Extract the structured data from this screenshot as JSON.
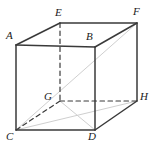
{
  "figure": {
    "name": "cube-diagram",
    "type": "geometric-solid",
    "solid": "cube",
    "background_color": "#ffffff",
    "stroke_color": "#3a3a3a",
    "hidden_stroke_color": "#3a3a3a",
    "faint_stroke_color": "#cfcfcf",
    "label_color": "#1a1a1a",
    "vertices": [
      {
        "id": "A",
        "label": "A",
        "x": 16,
        "y": 45,
        "label_x": 6,
        "label_y": 30,
        "hidden": false
      },
      {
        "id": "B",
        "label": "B",
        "x": 95,
        "y": 47,
        "label_x": 86,
        "label_y": 31,
        "hidden": false
      },
      {
        "id": "C",
        "label": "C",
        "x": 16,
        "y": 130,
        "label_x": 6,
        "label_y": 131,
        "hidden": false
      },
      {
        "id": "D",
        "label": "D",
        "x": 95,
        "y": 130,
        "label_x": 88,
        "label_y": 131,
        "hidden": false
      },
      {
        "id": "E",
        "label": "E",
        "x": 60,
        "y": 23,
        "label_x": 55,
        "label_y": 7,
        "hidden": false
      },
      {
        "id": "F",
        "label": "F",
        "x": 137,
        "y": 23,
        "label_x": 133,
        "label_y": 6,
        "hidden": false
      },
      {
        "id": "G",
        "label": "G",
        "x": 60,
        "y": 101,
        "label_x": 44,
        "label_y": 91,
        "hidden": true
      },
      {
        "id": "H",
        "label": "H",
        "x": 137,
        "y": 101,
        "label_x": 140,
        "label_y": 91,
        "hidden": false
      }
    ],
    "edges": [
      {
        "from": "A",
        "to": "B",
        "style": "solid",
        "name": "edge-ab"
      },
      {
        "from": "A",
        "to": "C",
        "style": "solid",
        "name": "edge-ac"
      },
      {
        "from": "B",
        "to": "D",
        "style": "solid",
        "name": "edge-bd"
      },
      {
        "from": "C",
        "to": "D",
        "style": "solid",
        "name": "edge-cd"
      },
      {
        "from": "A",
        "to": "E",
        "style": "solid",
        "name": "edge-ae"
      },
      {
        "from": "B",
        "to": "F",
        "style": "solid",
        "name": "edge-bf"
      },
      {
        "from": "E",
        "to": "F",
        "style": "solid",
        "name": "edge-ef"
      },
      {
        "from": "F",
        "to": "H",
        "style": "solid",
        "name": "edge-fh"
      },
      {
        "from": "D",
        "to": "H",
        "style": "solid",
        "name": "edge-dh"
      },
      {
        "from": "E",
        "to": "G",
        "style": "dashed",
        "name": "edge-eg"
      },
      {
        "from": "G",
        "to": "C",
        "style": "dashed",
        "name": "edge-gc"
      },
      {
        "from": "G",
        "to": "H",
        "style": "dashed",
        "name": "edge-gh"
      }
    ],
    "faint_lines": [
      {
        "from": "C",
        "to": "F",
        "name": "faint-diagonal-cf"
      },
      {
        "from": "C",
        "to": "H",
        "name": "faint-diagonal-ch"
      },
      {
        "from": "G",
        "to": "D",
        "name": "faint-diagonal-gd"
      }
    ]
  }
}
